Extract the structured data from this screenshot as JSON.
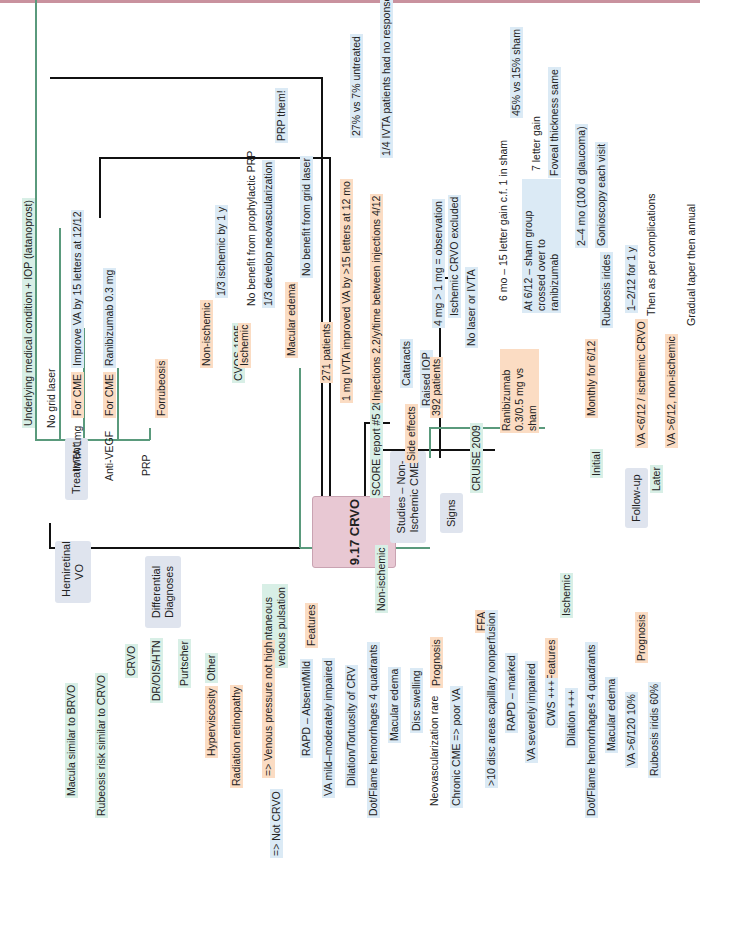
{
  "root": {
    "label": "9.17 CRVO",
    "color": "#e8c8d3"
  },
  "colors": {
    "level1_line": "#111111",
    "level2_line": "#5a9a7c",
    "level3_line": "#cf5b2e",
    "level4_line": "#4a4f8c",
    "level4b_line": "#4a8ec2",
    "top_rule": "#c9929e"
  },
  "treatment": {
    "label": "Treatment",
    "items": [
      {
        "label": "Underlying medical condition + IOP (latanoprost)"
      },
      {
        "label": "No grid laser"
      },
      {
        "label": "IVTA 1mg",
        "children": [
          {
            "label": "For CME",
            "children": [
              {
                "label": "Improve VA by 15 letters at 12/12"
              }
            ]
          }
        ]
      },
      {
        "label": "Anti-VEGF",
        "children": [
          {
            "label": "For CME",
            "children": [
              {
                "label": "Ranibizumab 0.3 mg"
              }
            ]
          }
        ]
      },
      {
        "label": "PRP",
        "children": [
          {
            "label": "Forrubeosis"
          }
        ]
      }
    ]
  },
  "studies": {
    "label": "Studies – Non-Ischemic CME",
    "cvos": {
      "label": "CVOS 1995",
      "items": [
        {
          "label": "Non-ischemic",
          "children": [
            {
              "label": "1/3 ischemic by 1 y"
            }
          ]
        },
        {
          "label": "Ischemic",
          "children": [
            {
              "label": "No benefit from prophylactic PRP"
            },
            {
              "label": "1/3 develop neovascularization",
              "children": [
                {
                  "label": "PRP them!"
                }
              ]
            }
          ]
        },
        {
          "label": "Macular edema",
          "children": [
            {
              "label": "No benefit from grid laser"
            }
          ]
        }
      ]
    },
    "score": {
      "label": "SCORE report #5 2009",
      "items": [
        {
          "label": "271 patients"
        },
        {
          "label": "1 mg IVTA improved VA by >15 letters at 12 mo",
          "children": [
            {
              "label": "27% vs 7% untreated"
            }
          ]
        },
        {
          "label": "Injections 2.2/y/time between injections 4/12",
          "children": [
            {
              "label": "1/4 IVTA patients had no response"
            }
          ]
        },
        {
          "label": "Side effects",
          "children": [
            {
              "label": "Cataracts"
            },
            {
              "label": "Raised IOP",
              "children": [
                {
                  "label": "4 mg > 1 mg = observation"
                }
              ]
            }
          ]
        }
      ]
    },
    "cruise": {
      "label": "CRUISE 2009",
      "items": [
        {
          "label": "392 patients",
          "children": [
            {
              "label": "Ischemic CRVO excluded"
            },
            {
              "label": "No laser or IVTA"
            }
          ]
        },
        {
          "label": "Ranibizumab 0.3/0.5 mg vs sham",
          "children": [
            {
              "label": "6 mo – 15 letter gain c.f. 1 in sham",
              "children": [
                {
                  "label": "45% vs 15% sham"
                }
              ]
            },
            {
              "label": "At 6/12 – sham group crossed over to ranibizumab",
              "children": [
                {
                  "label": "7 letter gain"
                },
                {
                  "label": "Foveal thickness same"
                }
              ]
            }
          ]
        }
      ]
    }
  },
  "followup": {
    "label": "Follow-up",
    "initial": {
      "label": "Initial",
      "items": [
        {
          "label": "Monthly for 6/12",
          "children": [
            {
              "label": "Rubeosis irides",
              "children": [
                {
                  "label": "2–4 mo (100 d glaucoma)"
                },
                {
                  "label": "Gonioscopy each visit"
                }
              ]
            }
          ]
        }
      ]
    },
    "later": {
      "label": "Later",
      "items": [
        {
          "label": "VA <6/12 / ischemic CRVO",
          "children": [
            {
              "label": "1–2/12 for 1 y"
            },
            {
              "label": "Then as per complications"
            }
          ]
        },
        {
          "label": "VA >6/12, non-ischemic",
          "children": [
            {
              "label": "Gradual taper then annual"
            }
          ]
        }
      ]
    }
  },
  "hemiretinal": {
    "label": "Hemiretinal VO",
    "items": [
      {
        "label": "Macula similar to BRVO"
      },
      {
        "label": "Rubeosis risk similar to CRVO"
      }
    ]
  },
  "differential": {
    "label": "Differential Diagnoses",
    "items": [
      {
        "label": "CRVO"
      },
      {
        "label": "DR/OIS/HTN"
      },
      {
        "label": "Purtscher"
      },
      {
        "label": "Other",
        "children": [
          {
            "label": "Hyperviscosity"
          },
          {
            "label": "Radiation retinopathy"
          }
        ]
      }
    ]
  },
  "signs": {
    "label": "Signs",
    "pulsation": {
      "label": "If spontaneous venous pulsation",
      "children": [
        {
          "label": "=> Venous pressure not high",
          "children": [
            {
              "label": "=> Not CRVO"
            }
          ]
        }
      ]
    },
    "non_ischemic": {
      "label": "Non-ischemic",
      "features": {
        "label": "Features",
        "items": [
          {
            "label": "RAPD – Absent/Mild"
          },
          {
            "label": "VA mild–moderately impaired"
          },
          {
            "label": "Dilation/Tortuosity of CRV"
          },
          {
            "label": "Dot/Flame hemorrhages 4 quadrants"
          },
          {
            "label": "Macular edema"
          },
          {
            "label": "Disc swelling"
          }
        ]
      },
      "prognosis": {
        "label": "Prognosis",
        "items": [
          {
            "label": "Neovascularization rare"
          },
          {
            "label": "Chronic CME => poor VA"
          }
        ]
      }
    },
    "ischemic": {
      "label": "Ischemic",
      "ffa": {
        "label": "FFA",
        "items": [
          {
            "label": ">10 disc areas capillary nonperfusion"
          }
        ]
      },
      "features": {
        "label": "Features",
        "items": [
          {
            "label": "RAPD – marked"
          },
          {
            "label": "VA severely impaired"
          },
          {
            "label": "CWS +++"
          },
          {
            "label": "Dilation +++"
          },
          {
            "label": "Dot/Flame hemorrhages 4 quadrants"
          },
          {
            "label": "Macular edema"
          }
        ]
      },
      "prognosis": {
        "label": "Prognosis",
        "items": [
          {
            "label": "VA >6/120 10%"
          },
          {
            "label": "Rubeosis iridis 60%"
          }
        ]
      }
    }
  }
}
